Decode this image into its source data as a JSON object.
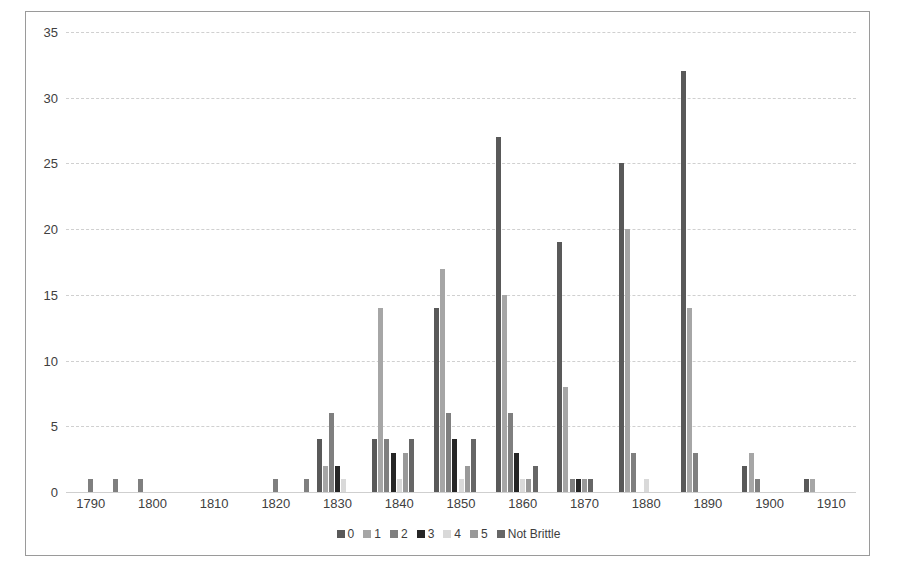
{
  "chart_data": {
    "type": "bar",
    "title": "",
    "xlabel": "",
    "ylabel": "",
    "ylim": [
      0,
      35
    ],
    "yticks": [
      0,
      5,
      10,
      15,
      20,
      25,
      30,
      35
    ],
    "xlim": [
      1786,
      1914
    ],
    "xticks": [
      1790,
      1800,
      1810,
      1820,
      1830,
      1840,
      1850,
      1860,
      1870,
      1880,
      1890,
      1900,
      1910
    ],
    "grid": "horizontal-dashed",
    "legend_position": "bottom-center",
    "bar_width_px": 5,
    "series": [
      {
        "name": "0",
        "color": "#595959",
        "points": [
          {
            "x": 1827,
            "y": 4
          },
          {
            "x": 1836,
            "y": 4
          },
          {
            "x": 1846,
            "y": 14
          },
          {
            "x": 1856,
            "y": 27
          },
          {
            "x": 1866,
            "y": 19
          },
          {
            "x": 1876,
            "y": 25
          },
          {
            "x": 1886,
            "y": 32
          },
          {
            "x": 1896,
            "y": 2
          },
          {
            "x": 1906,
            "y": 1
          }
        ]
      },
      {
        "name": "1",
        "color": "#a6a6a6",
        "points": [
          {
            "x": 1828,
            "y": 2
          },
          {
            "x": 1837,
            "y": 14
          },
          {
            "x": 1847,
            "y": 17
          },
          {
            "x": 1857,
            "y": 15
          },
          {
            "x": 1867,
            "y": 8
          },
          {
            "x": 1877,
            "y": 20
          },
          {
            "x": 1887,
            "y": 14
          },
          {
            "x": 1897,
            "y": 3
          },
          {
            "x": 1907,
            "y": 1
          }
        ]
      },
      {
        "name": "2",
        "color": "#7f7f7f",
        "points": [
          {
            "x": 1790,
            "y": 1
          },
          {
            "x": 1794,
            "y": 1
          },
          {
            "x": 1798,
            "y": 1
          },
          {
            "x": 1820,
            "y": 1
          },
          {
            "x": 1825,
            "y": 1
          },
          {
            "x": 1829,
            "y": 6
          },
          {
            "x": 1838,
            "y": 4
          },
          {
            "x": 1848,
            "y": 6
          },
          {
            "x": 1858,
            "y": 6
          },
          {
            "x": 1868,
            "y": 1
          },
          {
            "x": 1878,
            "y": 3
          },
          {
            "x": 1888,
            "y": 3
          },
          {
            "x": 1898,
            "y": 1
          }
        ]
      },
      {
        "name": "3",
        "color": "#262626",
        "points": [
          {
            "x": 1830,
            "y": 2
          },
          {
            "x": 1839,
            "y": 3
          },
          {
            "x": 1849,
            "y": 4
          },
          {
            "x": 1859,
            "y": 3
          },
          {
            "x": 1869,
            "y": 1
          }
        ]
      },
      {
        "name": "4",
        "color": "#d9d9d9",
        "points": [
          {
            "x": 1831,
            "y": 1
          },
          {
            "x": 1840,
            "y": 1
          },
          {
            "x": 1850,
            "y": 1
          },
          {
            "x": 1860,
            "y": 1
          },
          {
            "x": 1880,
            "y": 1
          }
        ]
      },
      {
        "name": "5",
        "color": "#999999",
        "points": [
          {
            "x": 1841,
            "y": 3
          },
          {
            "x": 1851,
            "y": 2
          },
          {
            "x": 1861,
            "y": 1
          },
          {
            "x": 1870,
            "y": 1
          }
        ]
      },
      {
        "name": "Not Brittle",
        "color": "#666666",
        "points": [
          {
            "x": 1842,
            "y": 4
          },
          {
            "x": 1852,
            "y": 4
          },
          {
            "x": 1862,
            "y": 2
          },
          {
            "x": 1871,
            "y": 1
          }
        ]
      }
    ],
    "legend": [
      {
        "label": "0",
        "color": "#595959"
      },
      {
        "label": "1",
        "color": "#a6a6a6"
      },
      {
        "label": "2",
        "color": "#7f7f7f"
      },
      {
        "label": "3",
        "color": "#262626"
      },
      {
        "label": "4",
        "color": "#d9d9d9"
      },
      {
        "label": "5",
        "color": "#999999"
      },
      {
        "label": "Not Brittle",
        "color": "#666666"
      }
    ]
  }
}
